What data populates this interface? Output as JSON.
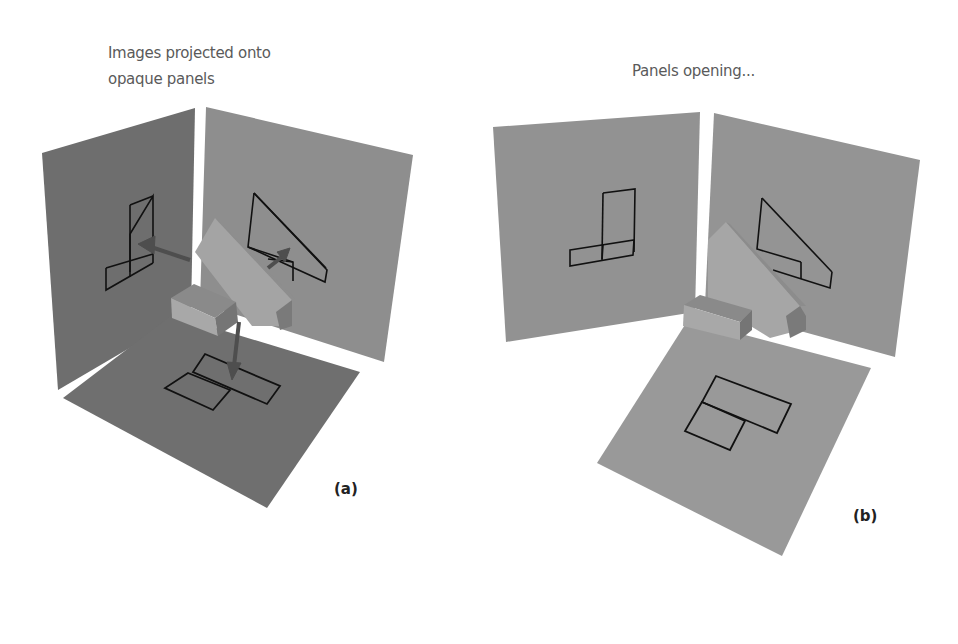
{
  "figure_a": {
    "caption_line1": "Images projected onto",
    "caption_line2": "opaque panels",
    "label": "(a)"
  },
  "figure_b": {
    "caption": "Panels opening...",
    "label": "(b)"
  },
  "colors": {
    "background": "#ffffff",
    "panel_dark": "#6e6e6e",
    "panel_mid": "#8c8c8c",
    "panel_light": "#9a9a9a",
    "object_light": "#a8a8a8",
    "object_mid": "#8a8a8a",
    "object_dark": "#707070",
    "outline": "#111111",
    "arrow": "#4e4e4e"
  }
}
